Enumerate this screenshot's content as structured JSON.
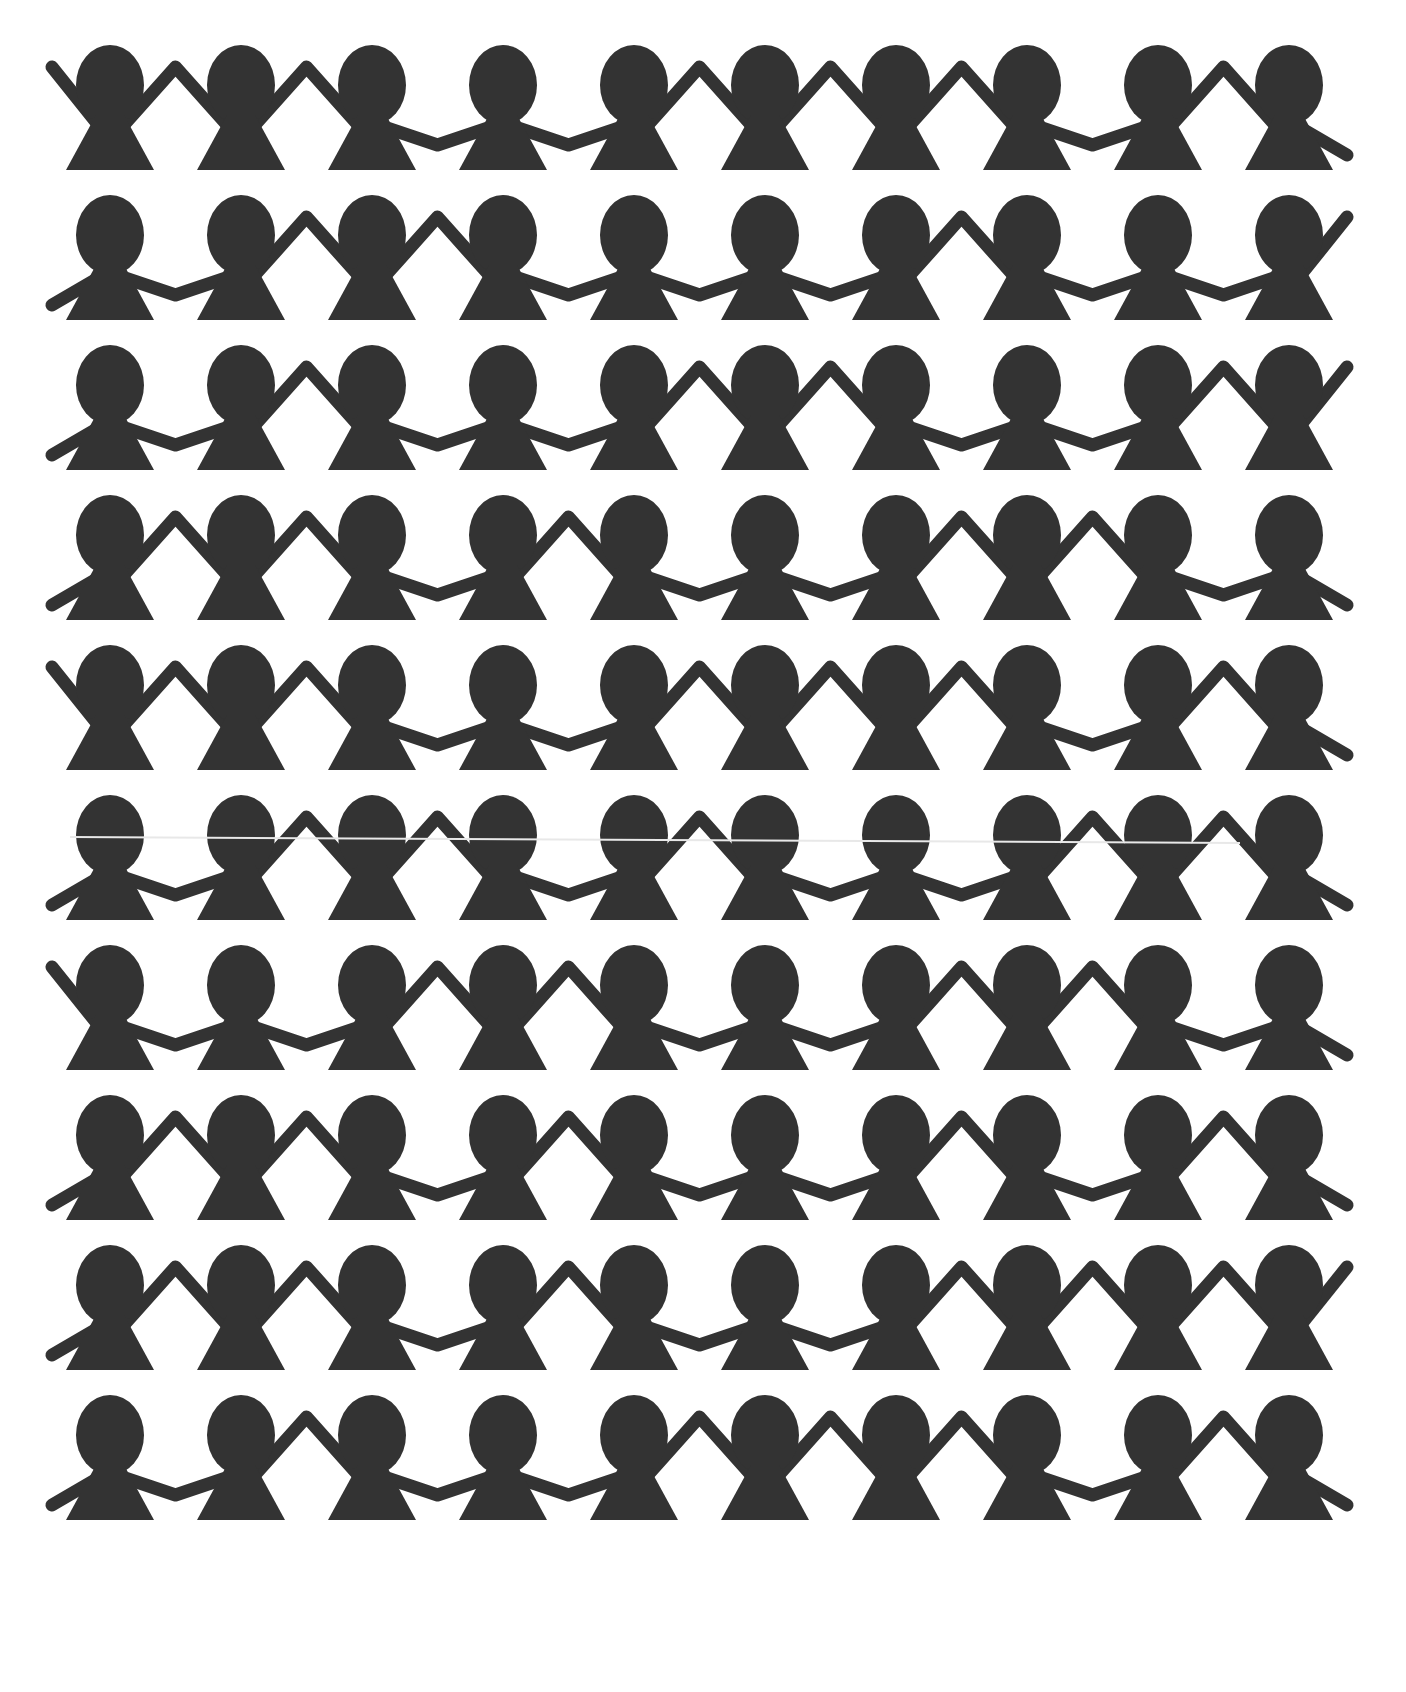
{
  "image": {
    "description": "Pattern of paper-doll silhouettes holding hands",
    "width": 1406,
    "height": 1692,
    "background": "#ffffff",
    "figure_color": "#333333"
  },
  "layout": {
    "rows": 10,
    "figures_per_row": 10,
    "first_center_x": 110,
    "spacing_x": 131,
    "first_row_top": 45,
    "row_spacing": 150
  },
  "rows": [
    {
      "outer_left": "up",
      "joints": [
        "up",
        "up",
        "down",
        "down",
        "up",
        "up",
        "up",
        "down",
        "up"
      ],
      "outer_right": "down"
    },
    {
      "outer_left": "down",
      "joints": [
        "down",
        "up",
        "up",
        "down",
        "down",
        "down",
        "up",
        "down",
        "down"
      ],
      "outer_right": "up"
    },
    {
      "outer_left": "down",
      "joints": [
        "down",
        "up",
        "down",
        "down",
        "up",
        "up",
        "down",
        "down",
        "up"
      ],
      "outer_right": "up"
    },
    {
      "outer_left": "down",
      "joints": [
        "up",
        "up",
        "down",
        "up",
        "down",
        "down",
        "up",
        "up",
        "down"
      ],
      "outer_right": "down"
    },
    {
      "outer_left": "up",
      "joints": [
        "up",
        "up",
        "down",
        "down",
        "up",
        "up",
        "up",
        "down",
        "up"
      ],
      "outer_right": "down"
    },
    {
      "outer_left": "down",
      "joints": [
        "down",
        "up",
        "up",
        "down",
        "up",
        "down",
        "down",
        "up",
        "up"
      ],
      "outer_right": "down",
      "scan_artifact": true
    },
    {
      "outer_left": "up",
      "joints": [
        "down",
        "down",
        "up",
        "up",
        "down",
        "down",
        "up",
        "up",
        "down"
      ],
      "outer_right": "down"
    },
    {
      "outer_left": "down",
      "joints": [
        "up",
        "up",
        "down",
        "up",
        "down",
        "down",
        "up",
        "down",
        "up"
      ],
      "outer_right": "down"
    },
    {
      "outer_left": "down",
      "joints": [
        "up",
        "up",
        "down",
        "up",
        "down",
        "down",
        "up",
        "up",
        "up"
      ],
      "outer_right": "up"
    },
    {
      "outer_left": "down",
      "joints": [
        "down",
        "up",
        "down",
        "down",
        "up",
        "up",
        "up",
        "down",
        "up"
      ],
      "outer_right": "down"
    }
  ]
}
